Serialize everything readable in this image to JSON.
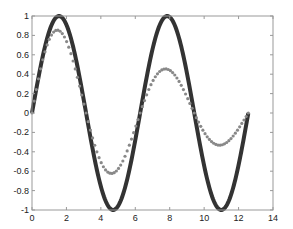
{
  "chart_data": {
    "type": "line",
    "title": "",
    "xlabel": "",
    "ylabel": "",
    "xlim": [
      0,
      14
    ],
    "ylim": [
      -1,
      1
    ],
    "grid": false,
    "legend": null,
    "x_ticks": [
      0,
      2,
      4,
      6,
      8,
      10,
      12,
      14
    ],
    "y_ticks": [
      -1,
      -0.8,
      -0.6,
      -0.4,
      -0.2,
      0,
      0.2,
      0.4,
      0.6,
      0.8,
      1
    ],
    "x_tick_labels": [
      "0",
      "2",
      "4",
      "6",
      "8",
      "10",
      "12",
      "14"
    ],
    "y_tick_labels": [
      "-1",
      "-0.8",
      "-0.6",
      "-0.4",
      "-0.2",
      "0",
      "0.2",
      "0.4",
      "0.6",
      "0.8",
      "1"
    ],
    "series": [
      {
        "name": "sin(x)",
        "style": "solid thick line",
        "color": "#333333",
        "x_range": [
          0,
          12.566
        ],
        "x": [
          0,
          1.571,
          3.142,
          4.712,
          6.283,
          7.854,
          9.425,
          10.996,
          12.566
        ],
        "values": [
          0,
          1,
          0,
          -1,
          0,
          1,
          0,
          -1,
          0
        ]
      },
      {
        "name": "damped sin(x)",
        "style": "asterisk markers",
        "color": "#888888",
        "x_range": [
          0,
          12.566
        ],
        "x": [
          0,
          1.571,
          3.142,
          4.712,
          6.283,
          7.854,
          9.425,
          10.996,
          12.566
        ],
        "values": [
          0,
          0.85,
          0,
          -0.63,
          0,
          0.45,
          0,
          -0.33,
          0
        ]
      }
    ]
  }
}
